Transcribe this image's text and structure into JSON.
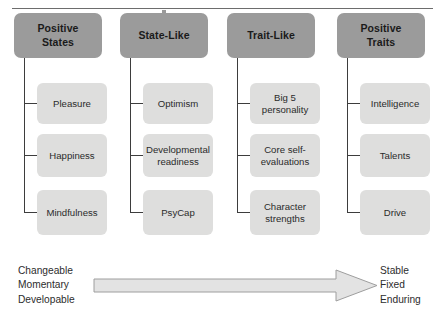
{
  "figure": {
    "columns": [
      {
        "header": "Positive\nStates",
        "header_line1": "Positive",
        "header_line2": "States",
        "items": [
          {
            "line1": "Pleasure",
            "line2": ""
          },
          {
            "line1": "Happiness",
            "line2": ""
          },
          {
            "line1": "Mindfulness",
            "line2": ""
          }
        ]
      },
      {
        "header": "State-Like",
        "header_line1": "State-Like",
        "header_line2": "",
        "items": [
          {
            "line1": "Optimism",
            "line2": ""
          },
          {
            "line1": "Developmental",
            "line2": "readiness"
          },
          {
            "line1": "PsyCap",
            "line2": ""
          }
        ]
      },
      {
        "header": "Trait-Like",
        "header_line1": "Trait-Like",
        "header_line2": "",
        "items": [
          {
            "line1": "Big 5",
            "line2": "personality"
          },
          {
            "line1": "Core self-",
            "line2": "evaluations"
          },
          {
            "line1": "Character",
            "line2": "strengths"
          }
        ]
      },
      {
        "header": "Positive\nTraits",
        "header_line1": "Positive",
        "header_line2": "Traits",
        "items": [
          {
            "line1": "Intelligence",
            "line2": ""
          },
          {
            "line1": "Talents",
            "line2": ""
          },
          {
            "line1": "Drive",
            "line2": ""
          }
        ]
      }
    ],
    "continuum": {
      "left_labels": [
        "Changeable",
        "Momentary",
        "Developable"
      ],
      "right_labels": [
        "Stable",
        "Fixed",
        "Enduring"
      ],
      "arrow_direction": "left-to-right"
    },
    "colors": {
      "header_box_fill": "#9b9b9b",
      "sub_box_fill": "#dededd",
      "connector_line": "#3d3d3d",
      "top_rule": "#6d6d6d",
      "arrow_fill": "#e3e3e3",
      "arrow_stroke": "#9e9e9e",
      "text_dark": "#1a1a1a",
      "text_body": "#2b2b2b"
    }
  }
}
